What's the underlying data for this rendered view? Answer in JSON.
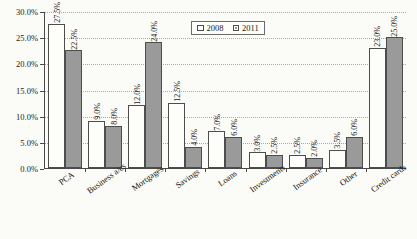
{
  "chart_data": {
    "type": "bar",
    "title": "",
    "subtitle": "",
    "xlabel": "",
    "ylabel": "",
    "ylim": [
      0,
      0.3
    ],
    "grid": true,
    "legend_position": "top-center",
    "categories": [
      "PCA",
      "Business a/cs",
      "Mortgages",
      "Savings",
      "Loans",
      "Investments",
      "Insurance",
      "Other",
      "Credit cards"
    ],
    "y_tick_labels": [
      "0.0%",
      "5.0%",
      "10.0%",
      "15.0%",
      "20.0%",
      "25.0%",
      "30.0%"
    ],
    "y_tick_values": [
      0,
      5,
      10,
      15,
      20,
      25,
      30
    ],
    "series": [
      {
        "name": "2008",
        "color": "#fdfdfa",
        "values": [
          27.5,
          9.0,
          12.0,
          12.5,
          7.0,
          3.0,
          2.5,
          3.5,
          23.0
        ],
        "data_labels": [
          "27.5%",
          "9.0%",
          "12.0%",
          "12.5%",
          "7.0%",
          "3.0%",
          "2.5%",
          "3.5%",
          "23.0%"
        ]
      },
      {
        "name": "2011",
        "color": "#9a9a9a",
        "values": [
          22.5,
          8.0,
          24.0,
          4.0,
          6.0,
          2.5,
          2.0,
          6.0,
          25.0
        ],
        "data_labels": [
          "22.5%",
          "8.0%",
          "24.0%",
          "4.0%",
          "6.0%",
          "2.5%",
          "2.0%",
          "6.0%",
          "25.0%"
        ]
      }
    ]
  },
  "legend": {
    "items": [
      {
        "label": "2008"
      },
      {
        "label": "2011"
      }
    ]
  },
  "colors": {
    "series_2008": "#fdfdfa",
    "series_2011": "#9a9a9a",
    "axis": "#4a4a4a",
    "grid": "#a9a9a9",
    "background": "#fbfbf7"
  }
}
